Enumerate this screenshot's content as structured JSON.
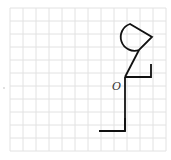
{
  "diagram": {
    "type": "grid-figure",
    "point_label": "O",
    "grid": {
      "x0": 10,
      "y0": 8,
      "cols": 12,
      "rows": 11,
      "cell": 13,
      "color": "#e2e2e2"
    },
    "figure": {
      "color": "#111111",
      "origin": [
        125,
        77
      ],
      "body": [
        [
          125,
          77
        ],
        [
          125,
          131
        ]
      ],
      "foot": [
        [
          99,
          131
        ],
        [
          125,
          131
        ],
        [
          125,
          118
        ]
      ],
      "neck": [
        [
          125,
          77
        ],
        [
          139,
          50
        ]
      ],
      "arm": [
        [
          125,
          77
        ],
        [
          151,
          77
        ],
        [
          151,
          64
        ]
      ],
      "head": {
        "arc_start": [
          139,
          50
        ],
        "arc_end": [
          130,
          24
        ],
        "tip": [
          152,
          37
        ]
      }
    }
  }
}
